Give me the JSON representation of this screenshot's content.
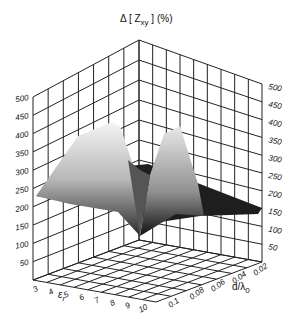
{
  "chart_data": {
    "type": "surface3d",
    "title_main": "Δ [ Z",
    "title_sub": "xy",
    "title_tail": " ] (%)",
    "xlabel": "ε_r",
    "xlabel_main": "ε",
    "xlabel_sub": "r",
    "ylabel": "d/λ_0",
    "ylabel_main": "d/λ",
    "ylabel_sub": "0",
    "zlabel": "Δ [ Z_xy ] (%)",
    "x_ticks": [
      "3",
      "4",
      "5",
      "6",
      "7",
      "8",
      "9",
      "10"
    ],
    "y_ticks": [
      "0.1",
      "0.08",
      "0.06",
      "0.04",
      "0.02"
    ],
    "z_ticks": [
      "50",
      "100",
      "150",
      "200",
      "250",
      "300",
      "350",
      "400",
      "450",
      "500"
    ],
    "zlim": [
      0,
      500
    ],
    "grid": true,
    "colormap": "grayscale",
    "peaks": [
      {
        "label": "left ridge",
        "z": 420
      },
      {
        "label": "right ridge",
        "z": 380
      },
      {
        "label": "valley minimum",
        "z": 0
      },
      {
        "label": "plateau",
        "z": 170
      }
    ]
  }
}
